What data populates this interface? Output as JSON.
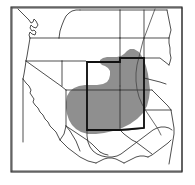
{
  "figure": {
    "kind": "range-distribution-map",
    "region_title": "Southwestern United States",
    "projection_note": "",
    "caption": ""
  },
  "frame": {
    "x": 11,
    "y": 7,
    "width": 171,
    "height": 165,
    "border_color": "#2b2b2b",
    "background_color": "#ffffff"
  },
  "colors": {
    "range_fill": "#8f8f8f",
    "state_border": "#2f2f2f",
    "highlight_border": "#111111",
    "coastline": "#2f2f2f",
    "river": "#444444",
    "land": "#ffffff"
  },
  "legend": {
    "range_label": "Shaded distribution range",
    "highlight_label": "Core range states"
  },
  "states_visible": [
    {
      "code": "WA",
      "name": "Washington",
      "shaded": false,
      "highlighted": false
    },
    {
      "code": "OR",
      "name": "Oregon",
      "shaded": false,
      "highlighted": false
    },
    {
      "code": "CA",
      "name": "California",
      "shaded": false,
      "highlighted": false
    },
    {
      "code": "NV",
      "name": "Nevada",
      "shaded": false,
      "highlighted": false
    },
    {
      "code": "ID",
      "name": "Idaho",
      "shaded": false,
      "highlighted": false
    },
    {
      "code": "MT",
      "name": "Montana",
      "shaded": false,
      "highlighted": false
    },
    {
      "code": "WY",
      "name": "Wyoming",
      "shaded": false,
      "highlighted": false
    },
    {
      "code": "UT",
      "name": "Utah",
      "shaded": false,
      "highlighted": false
    },
    {
      "code": "AZ",
      "name": "Arizona",
      "shaded": false,
      "highlighted": false
    },
    {
      "code": "CO",
      "name": "Colorado",
      "shaded": true,
      "highlighted": true
    },
    {
      "code": "NM",
      "name": "New Mexico",
      "shaded": true,
      "highlighted": true
    },
    {
      "code": "ND",
      "name": "North Dakota",
      "shaded": false,
      "highlighted": false
    },
    {
      "code": "SD",
      "name": "South Dakota",
      "shaded": false,
      "highlighted": false
    },
    {
      "code": "NE",
      "name": "Nebraska",
      "shaded": false,
      "highlighted": false
    },
    {
      "code": "KS",
      "name": "Kansas",
      "shaded": true,
      "highlighted": true
    },
    {
      "code": "OK",
      "name": "Oklahoma",
      "shaded": true,
      "highlighted": true
    },
    {
      "code": "TX",
      "name": "Texas",
      "shaded": true,
      "highlighted": false
    }
  ],
  "geometry": {
    "range_polygon": "M 134,49 L 139,52 L 143,58 L 146,66 L 148,74 L 149,82 L 150,90 L 149,98 L 147,106 L 143,113 L 137,119 L 130,124 L 122,128 L 113,131 L 104,133 L 96,134 L 88,134 L 81,132 L 76,129 L 72,125 L 69,120 L 67,114 L 66,108 L 66,102 L 67,96 L 70,91 L 74,88 L 79,86 L 85,85 L 91,85 L 97,85 L 103,84 L 107,82 L 109,79 L 110,75 L 110,71 L 108,68 L 105,66 L 102,65 L 100,63 L 100,60 L 103,58 L 107,57 L 112,57 L 117,57 L 121,56 L 124,54 L 127,51 L 130,49 Z",
    "state_lines": [
      "M 12,8 L 182,8",
      "M 12,8 L 12,171",
      "M 182,8 L 182,171",
      "M 12,171 L 182,171",
      "M 18,9 L 22,13 L 26,17 L 29,20 L 31,23 L 33,22 L 34,19 L 36,21 L 38,25 L 36,28 L 33,27 L 31,25 L 30,28 L 32,31 L 34,30 L 36,32 L 35,35 L 32,34 L 30,32 L 29,35 L 30,38",
      "M 30,38 L 37,38 L 45,38 L 52,38 L 59,38",
      "M 30,38 L 29,44 L 28,50 L 27,56 L 26,61",
      "M 26,61 L 34,61 L 42,61 L 50,61 L 57,61 L 62,61",
      "M 26,61 L 25,68 L 24,74 L 23,79",
      "M 23,79 L 26,83 L 29,86 L 31,90 L 30,93 L 32,96 L 34,99 L 33,102 L 35,105 L 38,108 L 40,112 L 43,115 L 45,119 L 48,122 L 50,126 L 53,129 L 56,132 L 58,136 L 60,140",
      "M 23,79 L 23,86 L 23,94 L 23,102 L 23,110 L 23,118 L 23,126 L 23,134 L 23,142",
      "M 60,140 L 62,137 L 64,134 L 65,130 L 66,126",
      "M 26,61 L 33,66 L 40,71 L 47,76 L 54,81 L 61,86 L 66,90",
      "M 59,38 L 60,31 L 62,25 L 64,20 L 66,16 L 69,13 L 72,11 L 76,10 L 80,10",
      "M 80,10 L 88,10 L 96,10 L 104,10 L 112,10 L 120,10",
      "M 120,10 L 120,17 L 120,24 L 120,31 L 120,38",
      "M 59,38 L 66,38 L 73,38 L 80,38 L 88,38 L 96,38 L 104,38 L 112,38 L 120,38",
      "M 120,38 L 128,38 L 136,38 L 144,38",
      "M 120,10 L 128,10 L 136,10 L 144,10 L 152,10 L 160,10 L 167,10",
      "M 144,10 L 144,17 L 144,24 L 144,31 L 144,38",
      "M 167,10 L 168,15 L 169,20 L 170,25 L 171,30 L 170,34 L 169,38",
      "M 144,38 L 152,38 L 160,38 L 169,38",
      "M 169,38 L 169,43 L 170,48 L 170,53 L 171,58 L 170,62 L 169,65",
      "M 144,38 L 144,45 L 144,52 L 144,58",
      "M 144,58 L 152,58 L 160,58 L 169,65",
      "M 120,38 L 120,45 L 120,52 L 120,58",
      "M 120,58 L 128,58 L 136,58 L 144,58",
      "M 62,61 L 62,68 L 62,75 L 62,82 L 62,86",
      "M 66,90 L 73,90 L 80,90 L 87,90",
      "M 87,90 L 87,83 L 87,76 L 87,69 L 87,62",
      "M 62,61 L 70,61 L 78,61 L 86,61 L 87,62",
      "M 87,62 L 95,62 L 103,62 L 111,62 L 119,62 L 120,58",
      "M 120,58 L 120,65 L 120,72 L 120,79 L 120,86",
      "M 87,90 L 95,90 L 103,90 L 111,90 L 120,90",
      "M 120,90 L 128,90 L 136,90 L 144,90 L 152,90",
      "M 120,86 L 120,90",
      "M 144,58 L 144,65 L 144,72 L 144,78",
      "M 144,78 L 152,80 L 160,82 L 166,84",
      "M 152,90 L 156,94 L 160,98 L 164,102 L 168,106 L 171,110",
      "M 144,90 L 144,97 L 144,104 L 144,110",
      "M 120,90 L 120,98 L 120,106 L 120,114 L 120,122 L 120,130",
      "M 87,90 L 87,98 L 87,106 L 87,114 L 87,122 L 87,130",
      "M 87,130 L 95,130 L 103,130 L 111,130 L 120,130",
      "M 120,130 L 128,130 L 136,129 L 144,128 L 144,110",
      "M 144,110 L 152,110 L 160,110 L 168,110 L 171,110",
      "M 66,90 L 66,98 L 66,106 L 66,114 L 66,122 L 66,126",
      "M 66,126 L 72,130 L 78,134 L 84,138 L 87,140",
      "M 87,130 L 87,136 L 88,142 L 90,147 L 93,151 L 97,154 L 102,156 L 107,157 L 112,157 L 117,156 L 121,154 L 125,151 L 129,148 L 133,145 L 137,142 L 141,139 L 145,136 L 149,133 L 153,130 L 157,128 L 161,127 L 165,127 L 169,128 L 172,130",
      "M 120,130 L 124,134 L 128,137 L 132,140 L 136,142",
      "M 87,140 L 92,144 L 96,148 L 100,152",
      "M 60,140 L 64,144 L 68,148 L 72,151 L 76,154 L 80,157 L 84,159 L 88,161 L 92,162 L 96,163",
      "M 96,163 L 100,161 L 104,159 L 108,158 L 112,158 L 116,159 L 120,161 L 124,163",
      "M 124,163 L 128,161 L 132,159 L 136,157 L 140,156 L 144,156 L 148,157",
      "M 148,157 L 152,155 L 156,152 L 160,149 L 164,146 L 168,143 L 171,140",
      "M 66,126 L 70,131 L 73,136 L 76,141 L 78,146 L 80,151",
      "M 100,152 L 104,154 L 108,155",
      "M 136,142 L 140,145 L 144,148 L 148,151 L 152,154",
      "M 171,110 L 172,116 L 173,122 L 174,128 L 174,134 L 173,140 L 172,146 L 171,152 L 170,158 L 169,164"
    ],
    "highlight_outline": "M 87,62 L 120,62 L 120,58 L 144,58 L 144,90 L 144,110 L 144,128 L 120,130 L 87,130 L 87,90 L 87,62 Z",
    "river_lines": [
      "M 155,9 L 152,17 L 149,25 L 146,33 L 143,41 L 141,49 L 139,57 L 137,65 L 136,73 L 136,81 L 137,89 L 139,97 L 142,104 L 146,111 L 150,117 L 154,123 L 158,129 L 161,135"
    ]
  }
}
